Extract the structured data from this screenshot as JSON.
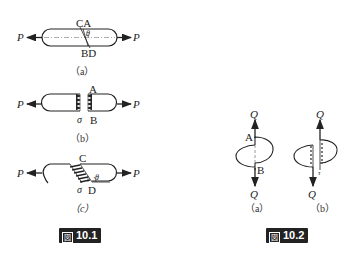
{
  "figure_10_1": {
    "caption": {
      "glyph": "図",
      "number": "10.1"
    },
    "panel_a": {
      "sublabel": "（a）",
      "force_left": "P",
      "force_right": "P",
      "top_points": "CA",
      "bottom_points": "BD",
      "angle": "θ"
    },
    "panel_b": {
      "sublabel": "（b）",
      "force_left": "P",
      "force_right": "P",
      "point_top": "A",
      "point_bottom": "B",
      "stress": "σ"
    },
    "panel_c": {
      "sublabel": "（c）",
      "force_left": "P",
      "force_right": "P",
      "point_top": "C",
      "point_bottom": "D",
      "stress": "σ",
      "angle": "θ"
    }
  },
  "figure_10_2": {
    "caption": {
      "glyph": "図",
      "number": "10.2"
    },
    "panel_a": {
      "sublabel": "（a）",
      "force_top": "Q",
      "force_bottom": "Q",
      "point_top": "A",
      "point_bottom": "B"
    },
    "panel_b": {
      "sublabel": "（b）",
      "force_top": "Q",
      "force_bottom": "Q",
      "stress": "τ"
    }
  },
  "colors": {
    "ink": "#222222",
    "badge_bg": "#222222",
    "badge_fg": "#ffffff"
  }
}
